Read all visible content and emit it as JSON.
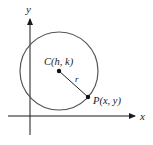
{
  "diagram": {
    "axes": {
      "x_label": "x",
      "y_label": "y"
    },
    "center": {
      "label": "C(h, k)"
    },
    "point": {
      "label": "P(x, y)"
    },
    "radius": {
      "label": "r"
    },
    "colors": {
      "axis": "#1a1a1a",
      "circle": "#555555",
      "radius_line": "#222222",
      "text": "#1a1a1a"
    }
  }
}
